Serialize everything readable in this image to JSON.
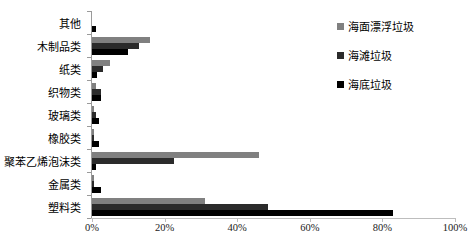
{
  "chart_data": {
    "type": "bar",
    "orientation": "horizontal",
    "title": "",
    "subtitle": "",
    "xlabel": "",
    "ylabel": "",
    "categories": [
      "其他",
      "木制品类",
      "纸类",
      "织物类",
      "玻璃类",
      "橡胶类",
      "聚苯乙烯泡沫类",
      "金属类",
      "塑料类"
    ],
    "series": [
      {
        "name": "海面漂浮垃圾",
        "color": "#808080",
        "values": [
          0.0,
          16.0,
          5.0,
          1.0,
          0.5,
          0.5,
          46.0,
          0.5,
          31.0
        ]
      },
      {
        "name": "海滩垃圾",
        "color": "#2b2b2b",
        "values": [
          0.0,
          13.0,
          3.0,
          2.5,
          1.0,
          0.5,
          22.5,
          0.5,
          48.5
        ]
      },
      {
        "name": "海底垃圾",
        "color": "#000000",
        "values": [
          1.0,
          10.0,
          1.5,
          2.5,
          2.0,
          2.0,
          1.0,
          2.5,
          83.0
        ]
      }
    ],
    "xlim": [
      0,
      100
    ],
    "xticks": [
      0,
      20,
      40,
      60,
      80,
      100
    ],
    "xtick_labels": [
      "0%",
      "20%",
      "40%",
      "60%",
      "80%",
      "100%"
    ],
    "grid": false,
    "legend_position": "right-top"
  }
}
